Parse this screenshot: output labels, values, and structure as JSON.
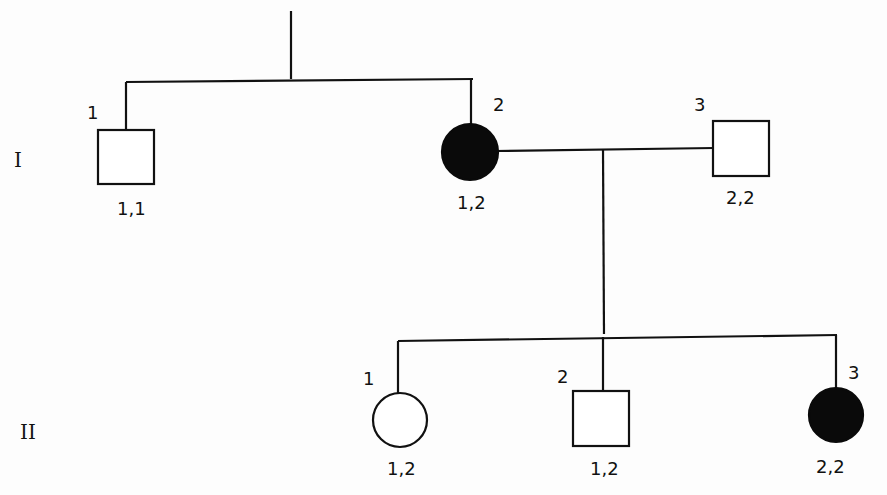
{
  "pedigree": {
    "generations": [
      {
        "label": "I"
      },
      {
        "label": "II"
      }
    ],
    "individuals": {
      "I-1": {
        "number": "1",
        "sex": "male",
        "affected": false,
        "genotype": "1,1"
      },
      "I-2": {
        "number": "2",
        "sex": "female",
        "affected": true,
        "genotype": "1,2"
      },
      "I-3": {
        "number": "3",
        "sex": "male",
        "affected": false,
        "genotype": "2,2"
      },
      "II-1": {
        "number": "1",
        "sex": "female",
        "affected": false,
        "genotype": "1,2"
      },
      "II-2": {
        "number": "2",
        "sex": "male",
        "affected": false,
        "genotype": "1,2"
      },
      "II-3": {
        "number": "3",
        "sex": "female",
        "affected": true,
        "genotype": "2,2"
      }
    },
    "colors": {
      "line": "#111111",
      "affected_fill": "#0a0a0a",
      "unaffected_fill": "#ffffff"
    }
  }
}
